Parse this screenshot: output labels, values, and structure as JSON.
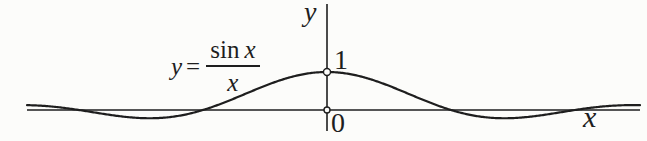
{
  "figure": {
    "y_axis_label": "y",
    "x_axis_label": "x",
    "peak_tick_label": "1",
    "origin_label": "0",
    "equation": {
      "lhs": "y",
      "equals": "=",
      "numerator_fn": "sin",
      "numerator_var": "x",
      "denominator": "x"
    }
  },
  "colors": {
    "ink": "#1e1e1e",
    "paper": "#fcfcfa"
  },
  "chart_data": {
    "type": "line",
    "xlabel": "x",
    "ylabel": "y",
    "grid": false,
    "legend": false,
    "series": [
      {
        "name": "y = sin x / x",
        "function": "sin(x)/x",
        "x_min": -7.6,
        "x_max": 7.93,
        "samples": 480
      }
    ],
    "key_points": [
      {
        "x": -6.283,
        "y": 0,
        "note": "zero at -2pi"
      },
      {
        "x": -4.493,
        "y": -0.217,
        "note": "local minimum"
      },
      {
        "x": -3.142,
        "y": 0,
        "note": "zero at -pi"
      },
      {
        "x": 0,
        "y": 1,
        "note": "removable discontinuity; limit equals 1 (open point)"
      },
      {
        "x": 3.142,
        "y": 0,
        "note": "zero at pi"
      },
      {
        "x": 4.493,
        "y": -0.217,
        "note": "local minimum"
      },
      {
        "x": 6.283,
        "y": 0,
        "note": "zero at 2pi"
      }
    ],
    "open_markers": [
      {
        "x": 0,
        "y": 1,
        "r": 3.5
      },
      {
        "x": 0,
        "y": 0,
        "r": 3.0
      }
    ],
    "axis_tick_labels": {
      "y_ticks": [
        {
          "value": 1,
          "label": "1"
        }
      ],
      "origin": "0"
    },
    "ylim": [
      -0.55,
      2.8
    ],
    "layout": {
      "origin_px": [
        327,
        110
      ],
      "px_per_unit_x": 39.47,
      "px_per_unit_y": 38,
      "x_axis_px": [
        27,
        640
      ],
      "y_axis_px": [
        4,
        131
      ],
      "curve_stroke_width": 2.2,
      "axis_stroke_width": 1.6,
      "marker_stroke_width": 1.4
    }
  }
}
